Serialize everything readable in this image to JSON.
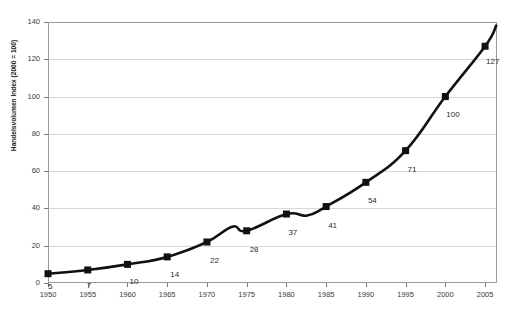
{
  "chart_data": {
    "type": "line",
    "title": "",
    "xlabel": "",
    "ylabel": "Handelsvolumen Index (2000 = 100)",
    "xlim": [
      1950,
      2006.5
    ],
    "ylim": [
      0,
      140
    ],
    "ytick_step": 20,
    "xtick_step": 5,
    "grid": "horizontal",
    "legend": "none",
    "marker": "filled-square",
    "line_color": "#111111",
    "grid_color": "#d8d8d8",
    "axis_color": "#9a9a9a",
    "x": [
      1950,
      1955,
      1960,
      1965,
      1970,
      1975,
      1980,
      1985,
      1990,
      1995,
      2000,
      2005
    ],
    "values": [
      5,
      7,
      10,
      14,
      22,
      28,
      37,
      41,
      54,
      71,
      100,
      127
    ],
    "point_labels": [
      "5",
      "7",
      "10",
      "14",
      "22",
      "28",
      "37",
      "41",
      "54",
      "71",
      "100",
      "127"
    ],
    "ytick_labels": [
      "0",
      "20",
      "40",
      "60",
      "80",
      "100",
      "120",
      "140"
    ],
    "xtick_labels": [
      "1950",
      "1955",
      "1960",
      "1965",
      "1970",
      "1975",
      "1980",
      "1985",
      "1990",
      "1995",
      "2000",
      "2005"
    ],
    "interpolation": "smooth",
    "extends_past_last_point_to": 138
  }
}
